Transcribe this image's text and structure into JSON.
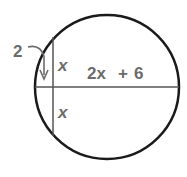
{
  "diagram": {
    "type": "circle-intersecting-chords",
    "labels": {
      "segment_outer": "2",
      "upper_chord_half": "x",
      "lower_chord_half": "x",
      "diameter_remainder_var": "2x",
      "diameter_remainder_op": "+",
      "diameter_remainder_const": "6"
    },
    "colors": {
      "circle": "#1a1a1a",
      "chord": "#555555",
      "label": "#6b6b6b"
    }
  }
}
